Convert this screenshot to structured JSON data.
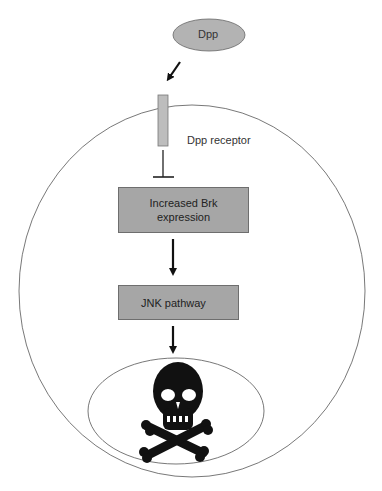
{
  "diagram": {
    "ligand": {
      "label": "Dpp",
      "fill": "#b3b3b3"
    },
    "receptor": {
      "label": "Dpp receptor",
      "fill": "#bdbdbd"
    },
    "nodes": [
      {
        "id": "brk",
        "label_line1": "Increased Brk",
        "label_line2": "expression"
      },
      {
        "id": "jnk",
        "label": "JNK pathway"
      }
    ],
    "outcome": {
      "icon": "skull-and-crossbones-icon",
      "glyph": "☠"
    },
    "edges": [
      {
        "from": "Dpp",
        "to": "Dpp receptor",
        "type": "arrow"
      },
      {
        "from": "Dpp receptor",
        "to": "Increased Brk expression",
        "type": "inhibition"
      },
      {
        "from": "Increased Brk expression",
        "to": "JNK pathway",
        "type": "arrow"
      },
      {
        "from": "JNK pathway",
        "to": "cell death",
        "type": "arrow"
      }
    ],
    "colors": {
      "box_fill": "#a6a6a6",
      "line": "#555555",
      "arrow": "#111111"
    }
  }
}
